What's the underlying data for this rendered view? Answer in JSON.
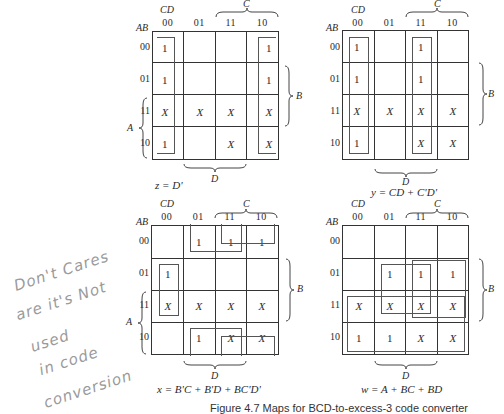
{
  "figure": {
    "caption": "Figure 4.7   Maps for BCD-to-excess-3 code converter",
    "axis_labels": {
      "row_vars": "AB",
      "col_vars": "CD",
      "col_codes": [
        "00",
        "01",
        "11",
        "10"
      ],
      "row_codes": [
        "00",
        "01",
        "11",
        "10"
      ],
      "brace_C": "C",
      "brace_D": "D",
      "brace_A": "A",
      "brace_B": "B"
    },
    "maps": [
      {
        "id": "z",
        "equation": "z = D'",
        "cells": [
          [
            "1",
            "",
            "",
            "1"
          ],
          [
            "1",
            "",
            "",
            "1"
          ],
          [
            "X",
            "X",
            "X",
            "X"
          ],
          [
            "1",
            "",
            "X",
            "X"
          ]
        ]
      },
      {
        "id": "y",
        "equation": "y = CD + C'D'",
        "cells": [
          [
            "1",
            "",
            "1",
            ""
          ],
          [
            "1",
            "",
            "1",
            ""
          ],
          [
            "X",
            "X",
            "X",
            "X"
          ],
          [
            "1",
            "",
            "X",
            "X"
          ]
        ]
      },
      {
        "id": "x",
        "equation": "x = B'C + B'D + BC'D'",
        "cells": [
          [
            "",
            "1",
            "1",
            "1"
          ],
          [
            "1",
            "",
            "",
            ""
          ],
          [
            "X",
            "X",
            "X",
            "X"
          ],
          [
            "",
            "1",
            "X",
            "X"
          ]
        ]
      },
      {
        "id": "w",
        "equation": "w = A + BC + BD",
        "cells": [
          [
            "",
            "",
            "",
            ""
          ],
          [
            "",
            "1",
            "1",
            "1"
          ],
          [
            "X",
            "X",
            "X",
            "X"
          ],
          [
            "1",
            "1",
            "X",
            "X"
          ]
        ]
      }
    ]
  },
  "handwritten_note": {
    "lines": [
      "Don't Cares",
      "are it's Not",
      "used",
      "in code",
      "conversion"
    ]
  }
}
